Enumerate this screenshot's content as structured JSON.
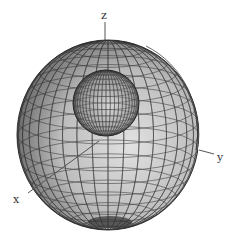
{
  "figure": {
    "axes": {
      "x": {
        "label": "x"
      },
      "y": {
        "label": "y"
      },
      "z": {
        "label": "z"
      }
    },
    "outer_sphere": {
      "cx": 108,
      "cy": 135,
      "rx": 91,
      "ry": 95,
      "fill_light": "#d9d9d9",
      "fill_dark": "#4a4a4a",
      "grid_color": "#2a2a2a"
    },
    "inner_sphere": {
      "cx": 106,
      "cy": 103,
      "r": 33,
      "fill_light": "#cfcfcf",
      "fill_dark": "#555555",
      "grid_color": "#333333"
    },
    "colors": {
      "background": "#ffffff",
      "axis": "#555555"
    }
  }
}
